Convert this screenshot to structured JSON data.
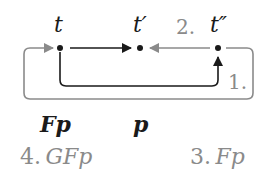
{
  "diagram": {
    "nodes": [
      {
        "id": "t",
        "label": "t"
      },
      {
        "id": "t1",
        "label": "t′"
      },
      {
        "id": "t2",
        "label": "t″"
      }
    ],
    "edges": [
      {
        "from": "t",
        "to": "t1",
        "style": "dark"
      },
      {
        "from": "t2",
        "to": "t1",
        "style": "gray",
        "label": "2."
      },
      {
        "from": "t",
        "to": "t2",
        "style": "dark",
        "route": "below",
        "label": "1."
      },
      {
        "from": "t2",
        "to": "t",
        "style": "gray",
        "route": "outer-loop"
      }
    ],
    "formulas": {
      "under_t": {
        "text": "Fp"
      },
      "under_t1": {
        "text": "p"
      },
      "step4": {
        "num": "4.",
        "text": "GFp"
      },
      "step3": {
        "num": "3.",
        "text": "Fp"
      }
    },
    "colors": {
      "dark": "#1a1a1a",
      "gray": "#8a8a8a"
    }
  }
}
